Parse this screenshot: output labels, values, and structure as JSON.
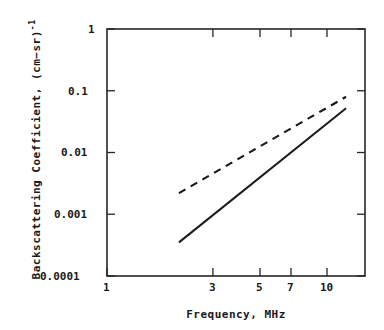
{
  "chart_data": {
    "type": "line",
    "title": "",
    "subtitle": "",
    "xlabel": "Frequency, MHz",
    "ylabel": "Backscattering Coefficient, (cm−sr)",
    "ylabel_exponent": "-1",
    "xscale": "log",
    "yscale": "log",
    "xlim": [
      1,
      12
    ],
    "ylim": [
      0.0001,
      1
    ],
    "grid": false,
    "legend": null,
    "xticks": [
      1,
      3,
      5,
      7,
      10
    ],
    "xtick_labels": [
      "1",
      "3",
      "5",
      "7",
      "10"
    ],
    "yticks": [
      0.0001,
      0.001,
      0.01,
      0.1,
      1
    ],
    "ytick_labels": [
      "0.0001",
      "0.001",
      "0.01",
      "0.1",
      "1"
    ],
    "series": [
      {
        "name": "dashed-curve",
        "style": "dashed",
        "color": "#1a1a1a",
        "x": [
          2,
          10
        ],
        "y": [
          0.0022,
          0.08
        ],
        "slope_loglog": 2.23
      },
      {
        "name": "solid-curve",
        "style": "solid",
        "color": "#1a1a1a",
        "x": [
          2,
          10
        ],
        "y": [
          0.00035,
          0.052
        ],
        "slope_loglog": 3.1
      }
    ]
  },
  "axes": {
    "frame_color": "#262626",
    "tick_color": "#262626"
  }
}
